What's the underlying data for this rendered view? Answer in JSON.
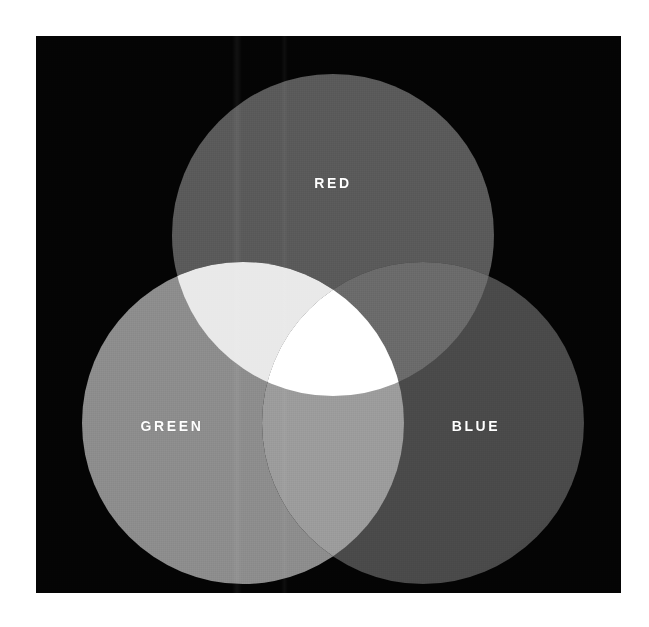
{
  "figure": {
    "background_color": "#ffffff",
    "plate_color": "#040404"
  },
  "diagram": {
    "type": "venn-3",
    "labels": {
      "red": "RED",
      "green": "GREEN",
      "blue": "BLUE"
    },
    "label_color": "#ffffff",
    "circles": [
      {
        "name": "red",
        "label": "RED",
        "cx": 297,
        "cy": 199,
        "r": 161,
        "fill": "#5a5a5a",
        "label_x": 297,
        "label_y": 147
      },
      {
        "name": "green",
        "label": "GREEN",
        "cx": 207,
        "cy": 387,
        "r": 161,
        "fill": "#8d8d8d",
        "label_x": 136,
        "label_y": 390
      },
      {
        "name": "blue",
        "label": "BLUE",
        "cx": 387,
        "cy": 387,
        "r": 161,
        "fill": "#4a4a4a",
        "label_x": 440,
        "label_y": 390
      }
    ],
    "intersections": [
      {
        "name": "red-green",
        "mix_label": "yellow",
        "fill": "#e9e9e9"
      },
      {
        "name": "red-blue",
        "mix_label": "magenta",
        "fill": "#6b6b6b"
      },
      {
        "name": "green-blue",
        "mix_label": "cyan",
        "fill": "#9c9c9c"
      },
      {
        "name": "red-green-blue",
        "mix_label": "white",
        "fill": "#ffffff"
      }
    ]
  }
}
